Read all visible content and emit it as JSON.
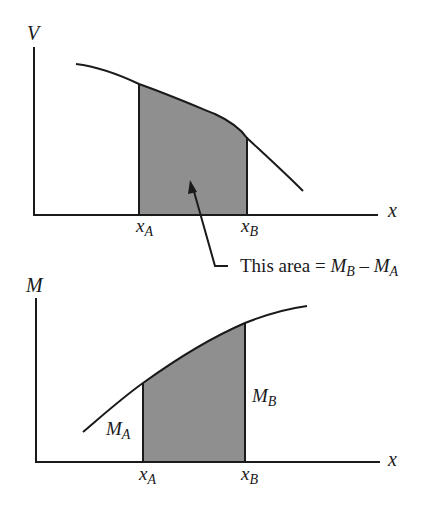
{
  "colors": {
    "line": "#1a1a1a",
    "shade": "#8f8f8f",
    "background": "#ffffff"
  },
  "top_graph": {
    "y_axis_label": "V",
    "x_axis_label": "x",
    "x_a_label": {
      "main": "x",
      "sub": "A"
    },
    "x_b_label": {
      "main": "x",
      "sub": "B"
    },
    "curve": "decreasing shear curve",
    "shaded_region": "area under V between xA and xB"
  },
  "annotation": {
    "prefix": "This area = ",
    "mb_main": "M",
    "mb_sub": "B",
    "minus": " – ",
    "ma_main": "M",
    "ma_sub": "A"
  },
  "bottom_graph": {
    "y_axis_label": "M",
    "x_axis_label": "x",
    "x_a_label": {
      "main": "x",
      "sub": "A"
    },
    "x_b_label": {
      "main": "x",
      "sub": "B"
    },
    "m_a_label": {
      "main": "M",
      "sub": "A"
    },
    "m_b_label": {
      "main": "M",
      "sub": "B"
    },
    "curve": "increasing moment curve",
    "shaded_region": "between xA and xB under M"
  }
}
